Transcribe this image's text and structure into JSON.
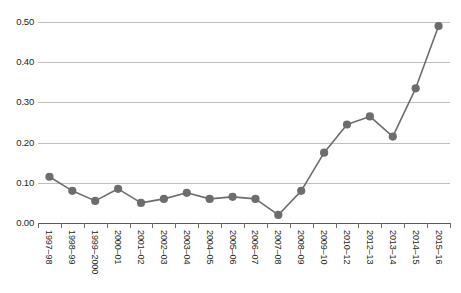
{
  "chart_data": {
    "type": "line",
    "title": "",
    "subtitle": "",
    "xlabel": "",
    "ylabel": "",
    "categories": [
      "1997–98",
      "1998–99",
      "1999–2000",
      "2000–01",
      "2001–02",
      "2002–03",
      "2003–04",
      "2004–05",
      "2005–06",
      "2006–07",
      "2007–08",
      "2008–09",
      "2009–10",
      "2010–12",
      "2012–13",
      "2013–14",
      "2014–15",
      "2015–16"
    ],
    "values": [
      0.115,
      0.08,
      0.055,
      0.085,
      0.05,
      0.06,
      0.075,
      0.06,
      0.065,
      0.06,
      0.02,
      0.08,
      0.175,
      0.245,
      0.265,
      0.215,
      0.335,
      0.49
    ],
    "ylim": [
      0.0,
      0.5
    ],
    "ytick_labels": [
      "0.00",
      "0.10",
      "0.20",
      "0.30",
      "0.40",
      "0.50"
    ],
    "ytick_values": [
      0.0,
      0.1,
      0.2,
      0.3,
      0.4,
      0.5
    ],
    "grid": true,
    "legend": "none",
    "series": [
      {
        "name": "",
        "marker": "circle",
        "line_color": "#6d6d6d",
        "marker_color": "#6d6d6d",
        "values": [
          0.115,
          0.08,
          0.055,
          0.085,
          0.05,
          0.06,
          0.075,
          0.06,
          0.065,
          0.06,
          0.02,
          0.08,
          0.175,
          0.245,
          0.265,
          0.215,
          0.335,
          0.49
        ]
      }
    ]
  },
  "colors": {
    "background": "#ffffff",
    "gridline": "#bfbfbf",
    "axis": "#6f6f6f",
    "series": "#6d6d6d",
    "text": "#231f20"
  }
}
